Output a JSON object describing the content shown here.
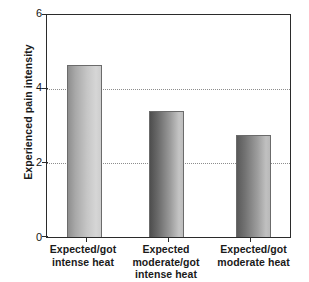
{
  "chart_data": {
    "type": "bar",
    "title": "",
    "xlabel": "",
    "ylabel": "Experienced pain intensity",
    "categories": [
      "Expected/got intense heat",
      "Expected moderate/got intense heat",
      "Expected/got moderate heat"
    ],
    "category_lines": [
      [
        "Expected/got",
        "intense heat"
      ],
      [
        "Expected",
        "moderate/got",
        "intense heat"
      ],
      [
        "Expected/got",
        "moderate heat"
      ]
    ],
    "values": [
      4.65,
      3.4,
      2.75
    ],
    "ylim": [
      0,
      6
    ],
    "yticks": [
      0,
      2,
      4,
      6
    ],
    "ytick_labels": [
      "0",
      "2",
      "4",
      "6"
    ],
    "gridlines": [
      2,
      4
    ],
    "grid": "horizontal-dotted",
    "legend": "none",
    "bar_style": "grayscale-gradient-left-dark-to-right-light"
  },
  "colors": {
    "axis": "#2b2b2b",
    "grid": "#8d8d8d",
    "text": "#1a1a1a",
    "background": "#ffffff",
    "bar_outline": "#6b6b6b"
  }
}
